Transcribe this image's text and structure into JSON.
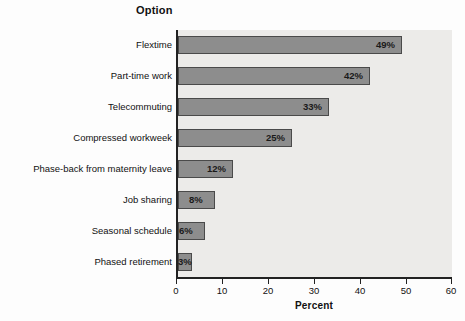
{
  "chart_data": {
    "type": "bar",
    "orientation": "horizontal",
    "title": "Option",
    "xlabel": "Percent",
    "ylabel": "",
    "categories": [
      "Flextime",
      "Part-time work",
      "Telecommuting",
      "Compressed workweek",
      "Phase-back from maternity leave",
      "Job sharing",
      "Seasonal schedule",
      "Phased retirement"
    ],
    "values": [
      49,
      42,
      33,
      25,
      12,
      8,
      6,
      3
    ],
    "data_labels": [
      "49%",
      "42%",
      "33%",
      "25%",
      "12%",
      "8%",
      "6%",
      "3%"
    ],
    "xlim": [
      0,
      60
    ],
    "xticks": [
      0,
      10,
      20,
      30,
      40,
      50,
      60
    ],
    "xtick_labels": [
      "0",
      "10",
      "20",
      "30",
      "40",
      "50",
      "60"
    ],
    "grid": false,
    "legend": null,
    "colors": {
      "bar_fill": "#8d8d8d",
      "bar_border": "#4a4a4a",
      "plot_background": "#ecebe9",
      "axis": "#222222",
      "text": "#111111",
      "page_background": "#fdfdfd"
    }
  }
}
